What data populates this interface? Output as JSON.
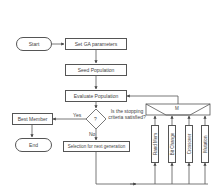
{
  "diagram": {
    "type": "flowchart",
    "nodes": {
      "start": "Start",
      "set_params": "Set GA parameters",
      "seed": "Seed Population",
      "evaluate": "Evaluate Population",
      "decision": "?",
      "decision_question": "Is the stopping criteria satisfied?",
      "best_member": "Best Member",
      "end": "End",
      "selection": "Selection for next generation",
      "combiner": "M"
    },
    "edge_labels": {
      "yes": "Yes",
      "no": "No"
    },
    "operators": [
      {
        "label": "Rand Mem"
      },
      {
        "label": "Bit Change"
      },
      {
        "label": "Crossover"
      },
      {
        "label": "Mutation"
      }
    ]
  }
}
